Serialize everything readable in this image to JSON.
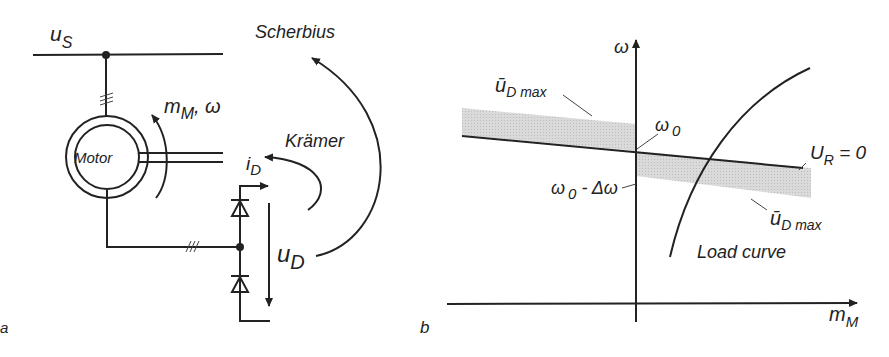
{
  "panel_a": {
    "panel_label": "a",
    "supply_voltage": "u",
    "supply_voltage_sub": "S",
    "motor_label": "Motor",
    "torque_speed": "m",
    "torque_speed_sub": "M",
    "torque_speed_suffix": ", ω",
    "scherbius_label": "Scherbius",
    "kramer_label": "Krämer",
    "dc_current": "i",
    "dc_current_sub": "D",
    "dc_voltage": "u",
    "dc_voltage_sub": "D"
  },
  "panel_b": {
    "panel_label": "b",
    "y_axis_label": "ω",
    "x_axis_label": "m",
    "x_axis_label_sub": "M",
    "omega0": "ω",
    "omega0_sub": "0",
    "omega0_minus": "ω",
    "omega0_minus_sub": "0",
    "omega0_minus_suffix": " - Δω",
    "udmax_upper": "ū",
    "udmax_upper_sub": "D max",
    "udmax_lower": "ū",
    "udmax_lower_sub": "D max",
    "ur_label": "U",
    "ur_label_sub": "R",
    "ur_label_suffix": " = 0",
    "load_curve_label": "Load curve"
  },
  "colors": {
    "line": "#222222",
    "shading": "#d6d6d6"
  }
}
